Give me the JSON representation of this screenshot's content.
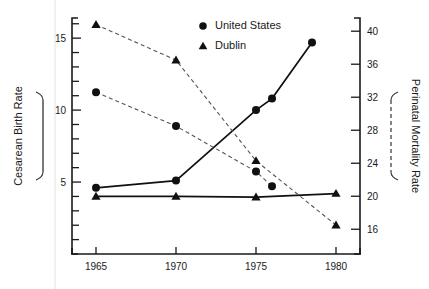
{
  "chart_data": {
    "type": "line",
    "title": "",
    "xlabel": "",
    "x_tick_labels": [
      "1965",
      "1970",
      "1975",
      "1980"
    ],
    "x_ticks": [
      1965,
      1970,
      1975,
      1980
    ],
    "xlim": [
      1963.5,
      1981.5
    ],
    "left_axis": {
      "label": "Cesarean Birth Rate",
      "line_style": "solid",
      "tick_labels": [
        "5",
        "10",
        "15"
      ],
      "labeled_ticks": [
        5,
        10,
        15
      ],
      "minor_tick_step": 1,
      "ylim": [
        0,
        16.4
      ]
    },
    "right_axis": {
      "label": "Perinatal Mortality Rate",
      "line_style": "dashed",
      "tick_labels": [
        "16",
        "20",
        "24",
        "28",
        "32",
        "36",
        "40"
      ],
      "labeled_ticks": [
        16,
        20,
        24,
        28,
        32,
        36,
        40
      ],
      "ylim": [
        13.0,
        41.6
      ]
    },
    "legend": {
      "position": "top-center",
      "entries": [
        {
          "label": "United States",
          "marker": "circle"
        },
        {
          "label": "Dublin",
          "marker": "triangle"
        }
      ]
    },
    "series": [
      {
        "name": "United States",
        "measure": "Cesarean Birth Rate",
        "axis": "left",
        "marker": "circle",
        "line_style": "solid",
        "points": [
          {
            "x": 1965,
            "y": 4.6
          },
          {
            "x": 1970,
            "y": 5.1
          },
          {
            "x": 1975,
            "y": 10.0
          },
          {
            "x": 1976,
            "y": 10.8
          },
          {
            "x": 1978.5,
            "y": 14.7
          }
        ]
      },
      {
        "name": "Dublin",
        "measure": "Cesarean Birth Rate",
        "axis": "left",
        "marker": "triangle",
        "line_style": "solid",
        "points": [
          {
            "x": 1965,
            "y": 4.0
          },
          {
            "x": 1970,
            "y": 4.0
          },
          {
            "x": 1975,
            "y": 3.95
          },
          {
            "x": 1980,
            "y": 4.2
          }
        ]
      },
      {
        "name": "United States",
        "measure": "Perinatal Mortality Rate",
        "axis": "right",
        "marker": "circle",
        "line_style": "dashed",
        "points": [
          {
            "x": 1965,
            "y": 32.6
          },
          {
            "x": 1970,
            "y": 28.5
          },
          {
            "x": 1975,
            "y": 23.0
          },
          {
            "x": 1976,
            "y": 21.2
          }
        ]
      },
      {
        "name": "Dublin",
        "measure": "Perinatal Mortality Rate",
        "axis": "right",
        "marker": "triangle",
        "line_style": "dashed",
        "points": [
          {
            "x": 1965,
            "y": 40.8
          },
          {
            "x": 1970,
            "y": 36.5
          },
          {
            "x": 1975,
            "y": 24.3
          },
          {
            "x": 1980,
            "y": 16.5
          }
        ]
      }
    ]
  }
}
